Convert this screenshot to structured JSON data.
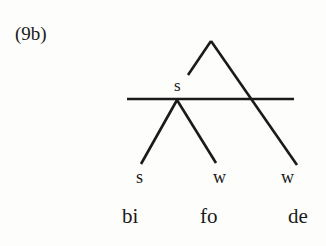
{
  "example": {
    "label": "(9b)"
  },
  "tree": {
    "internal_node": {
      "label": "s"
    },
    "leaves": [
      {
        "label": "s"
      },
      {
        "label": "w"
      },
      {
        "label": "w"
      }
    ],
    "syllables": [
      "bi",
      "fo",
      "de"
    ]
  },
  "colors": {
    "ink": "#1a1a1a",
    "background": "#fdfdfb"
  }
}
